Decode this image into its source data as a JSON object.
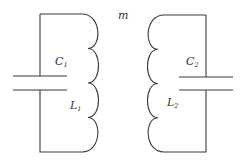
{
  "diagram": {
    "type": "coupled LC circuits",
    "mutual_label": "m",
    "left_circuit": {
      "capacitor": {
        "symbol": "C",
        "subscript": "1"
      },
      "inductor": {
        "symbol": "L",
        "subscript": "1",
        "turns": 4
      }
    },
    "right_circuit": {
      "capacitor": {
        "symbol": "C",
        "subscript": "2"
      },
      "inductor": {
        "symbol": "L",
        "subscript": "2",
        "turns": 4
      }
    },
    "colors": {
      "line": "#3a3a3a",
      "text": "#333333",
      "background": "#ffffff"
    }
  }
}
